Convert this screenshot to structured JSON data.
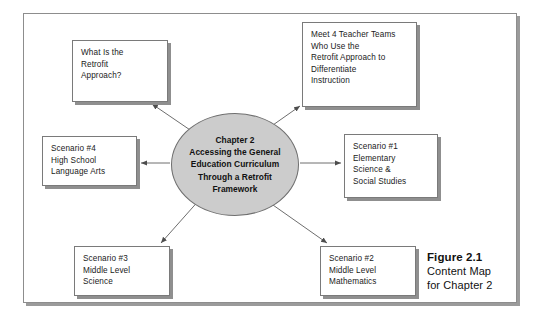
{
  "figure": {
    "caption_title": "Figure 2.1",
    "caption_body": "Content Map\nfor Chapter 2"
  },
  "center": {
    "label": "Chapter 2\nAccessing the General\nEducation Curriculum\nThrough a Retrofit\nFramework"
  },
  "nodes": [
    {
      "id": "what-is-retrofit",
      "label": "What Is the\nRetrofit\nApproach?"
    },
    {
      "id": "meet-teachers",
      "label": "Meet 4 Teacher Teams\nWho Use the\nRetrofit Approach to\nDifferentiate\nInstruction"
    },
    {
      "id": "scenario-4",
      "label": "Scenario #4\nHigh School\nLanguage Arts"
    },
    {
      "id": "scenario-1",
      "label": "Scenario #1\nElementary\nScience &\nSocial Studies"
    },
    {
      "id": "scenario-3",
      "label": "Scenario #3\nMiddle Level\nScience"
    },
    {
      "id": "scenario-2",
      "label": "Scenario #2\nMiddle Level\nMathematics"
    }
  ],
  "colors": {
    "ellipse_fill": "#cccccc",
    "box_fill": "#ffffff",
    "stroke": "#7a7a7a",
    "shadow": "#8f8f8f",
    "text": "#1a1a1a",
    "background": "#ffffff"
  }
}
